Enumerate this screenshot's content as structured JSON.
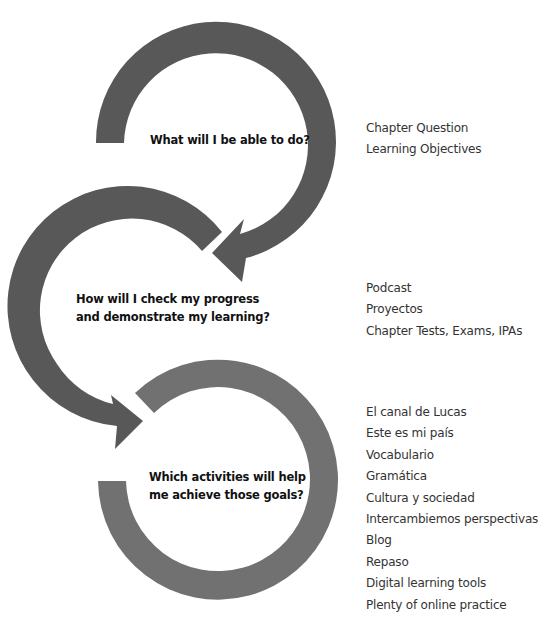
{
  "diagram": {
    "colors": {
      "arrow": "#585858",
      "cycle": "#717171",
      "text": "#111111",
      "list_text": "#333333"
    },
    "steps": [
      {
        "question": "What will I be able to do?",
        "items": [
          "Chapter Question",
          "Learning Objectives"
        ]
      },
      {
        "question_lines": [
          "How will I check my progress",
          "and demonstrate my learning?"
        ],
        "items": [
          "Podcast",
          "Proyectos",
          "Chapter Tests, Exams, IPAs"
        ]
      },
      {
        "question_lines": [
          "Which activities will help",
          "me achieve those goals?"
        ],
        "items": [
          "El canal de Lucas",
          "Este es mi país",
          "Vocabulario",
          "Gramática",
          "Cultura y sociedad",
          "Intercambiemos perspectivas",
          "Blog",
          "Repaso",
          "Digital learning tools",
          "Plenty of online practice"
        ]
      }
    ]
  }
}
